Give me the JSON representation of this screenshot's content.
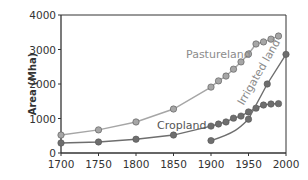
{
  "chart_data": {
    "type": "line",
    "title": "",
    "xlabel": "",
    "ylabel": "Area (Mha)",
    "xlim": [
      1700,
      2000
    ],
    "ylim": [
      0,
      4000
    ],
    "xticks": [
      1700,
      1750,
      1800,
      1850,
      1900,
      1950,
      2000
    ],
    "yticks": [
      0,
      1000,
      2000,
      3000,
      4000
    ],
    "grid": false,
    "legend": "inline labels",
    "series": [
      {
        "name": "Pastureland",
        "color": "#a6a6a6",
        "x": [
          1700,
          1750,
          1800,
          1850,
          1900,
          1910,
          1920,
          1930,
          1940,
          1950,
          1960,
          1970,
          1980,
          1990
        ],
        "values": [
          520,
          670,
          900,
          1275,
          1910,
          2090,
          2230,
          2430,
          2640,
          2870,
          3160,
          3220,
          3300,
          3390
        ]
      },
      {
        "name": "Cropland",
        "color": "#6e6e6e",
        "x": [
          1700,
          1750,
          1800,
          1850,
          1900,
          1910,
          1920,
          1930,
          1940,
          1950,
          1960,
          1970,
          1980,
          1990
        ],
        "values": [
          290,
          320,
          400,
          520,
          780,
          840,
          900,
          1010,
          1070,
          1190,
          1300,
          1390,
          1420,
          1430
        ]
      },
      {
        "name": "Irrigated land",
        "color": "#6e6e6e",
        "x": [
          1900,
          1950,
          1975,
          2000
        ],
        "values": [
          360,
          980,
          2000,
          2860
        ]
      }
    ]
  },
  "labels": {
    "ylabel": "Area (Mha)",
    "pastureland": "Pastureland",
    "cropland": "Cropland",
    "irrigated": "Irrigated land"
  }
}
